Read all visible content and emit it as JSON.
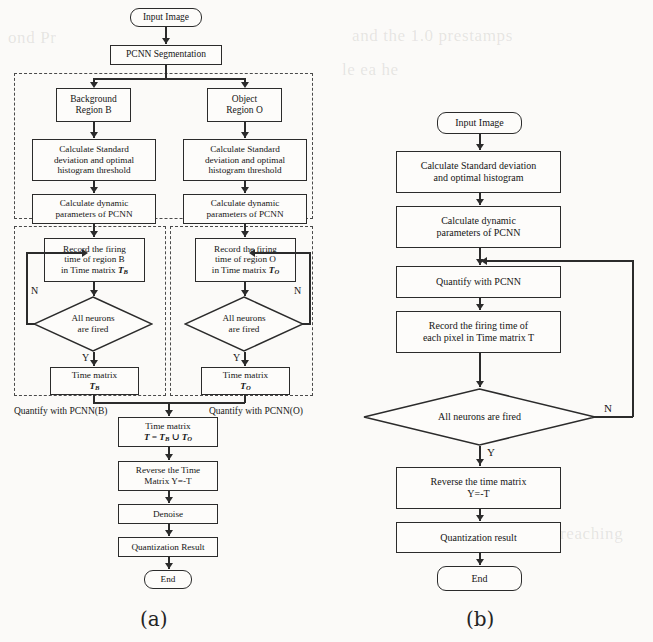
{
  "figure": {
    "captions": {
      "left": "(a)",
      "right": "(b)"
    }
  },
  "diagram_a": {
    "group_labels": {
      "hpcnn": "HPCNN",
      "quantify_b": "Quantify with PCNN(B)",
      "quantify_o": "Quantify with PCNN(O)"
    },
    "nodes": {
      "input": "Input Image",
      "segmentation": "PCNN Segmentation",
      "bg_region_l1": "Background",
      "bg_region_l2": "Region B",
      "obj_region_l1": "Object",
      "obj_region_l2": "Region O",
      "calc_std_b_l1": "Calculate Standard",
      "calc_std_b_l2": "deviation and optimal",
      "calc_std_b_l3": "histogram threshold",
      "calc_std_o_l1": "Calculate Standard",
      "calc_std_o_l2": "deviation and optimal",
      "calc_std_o_l3": "histogram threshold",
      "calc_dyn_b_l1": "Calculate dynamic",
      "calc_dyn_b_l2": "parameters of PCNN",
      "calc_dyn_o_l1": "Calculate dynamic",
      "calc_dyn_o_l2": "parameters of PCNN",
      "record_b_l1": "Record the firing",
      "record_b_l2": "time of region B",
      "record_b_l3_pre": "in Time matrix ",
      "record_b_l3_sym": "T",
      "record_b_l3_sub": "B",
      "record_o_l1": "Record the firing",
      "record_o_l2": "time of region O",
      "record_o_l3_pre": "in Time matrix ",
      "record_o_l3_sym": "T",
      "record_o_l3_sub": "O",
      "decision_b_l1": "All neurons",
      "decision_b_l2": "are fired",
      "decision_o_l1": "All neurons",
      "decision_o_l2": "are fired",
      "time_matrix_b_l1": "Time matrix",
      "time_matrix_b_sym": "T",
      "time_matrix_b_sub": "B",
      "time_matrix_o_l1": "Time matrix",
      "time_matrix_o_sym": "T",
      "time_matrix_o_sub": "O",
      "time_matrix_all_l1": "Time matrix",
      "time_matrix_all_formula": "T = T",
      "time_matrix_all_sub1": "B",
      "time_matrix_all_op": " ∪ T",
      "time_matrix_all_sub2": "O",
      "reverse_l1": "Reverse the Time",
      "reverse_l2": "Matrix Y=-T",
      "denoise": "Denoise",
      "quant_result": "Quantization Result",
      "end": "End"
    },
    "edge_labels": {
      "n_left": "N",
      "n_right": "N",
      "y_left": "Y",
      "y_right": "Y"
    }
  },
  "diagram_b": {
    "nodes": {
      "input": "Input Image",
      "calc_std_l1": "Calculate Standard deviation",
      "calc_std_l2": "and optimal histogram",
      "calc_dyn_l1": "Calculate dynamic",
      "calc_dyn_l2": "parameters of PCNN",
      "quantify": "Quantify with PCNN",
      "record_l1": "Record the firing time of",
      "record_l2": "each pixel in Time matrix T",
      "decision": "All neurons are fired",
      "reverse_l1": "Reverse the time matrix",
      "reverse_l2": "Y=-T",
      "quant_result": "Quantization result",
      "end": "End"
    },
    "edge_labels": {
      "n": "N",
      "y": "Y"
    }
  },
  "colors": {
    "stroke": "#2b2b2b",
    "dashed_stroke": "#4a4a4a",
    "page_background": "#fbfaf8",
    "node_fill": "#fdfcfa"
  },
  "ghost_text": {
    "g1": "and the 1.0 prestamps",
    "g2": "le ea he",
    "g3": "ond  Pr",
    "g4": "reaching"
  }
}
